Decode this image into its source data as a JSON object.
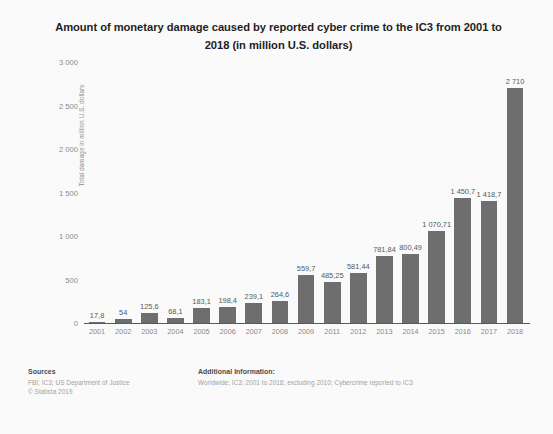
{
  "title": {
    "line1": "Amount of monetary damage caused by reported cyber crime to the IC3 from 2001 to",
    "line2": "2018 (in million U.S. dollars)"
  },
  "axis": {
    "y_title": "Total damage in million U.S. dollars",
    "y_ticks": [
      "3 000",
      "2 500",
      "2 000",
      "1 500",
      "1 000",
      "500",
      "0"
    ]
  },
  "footer": {
    "sources_head": "Sources",
    "sources_line1": "FBI; IC3; US Department of Justice",
    "sources_line2": "© Statista 2019",
    "info_head": "Additional Information:",
    "info_line1": "Worldwide; IC3; 2001 to 2018; excluding 2010; Cybercrime reported to IC3"
  },
  "colors": {
    "bar": "#6e6e6e",
    "axis": "#5a5a5a",
    "tick_text": "#8a8a8a",
    "background": "#fafafa"
  },
  "chart_data": {
    "type": "bar",
    "title": "Amount of monetary damage caused by reported cyber crime to the IC3 from 2001 to 2018 (in million U.S. dollars)",
    "xlabel": "",
    "ylabel": "Total damage in million U.S. dollars",
    "ylim": [
      0,
      3000
    ],
    "ytick_step": 500,
    "grid": false,
    "legend": "none",
    "categories": [
      "2001",
      "2002",
      "2003",
      "2004",
      "2005",
      "2006",
      "2007",
      "2008",
      "2009",
      "2011",
      "2012",
      "2013",
      "2014",
      "2015",
      "2016",
      "2017",
      "2018"
    ],
    "values": [
      17.8,
      54,
      125.6,
      68.1,
      183.1,
      198.4,
      239.1,
      264.6,
      559.7,
      485.25,
      581.44,
      781.84,
      800.49,
      1070.71,
      1450.7,
      1418.7,
      2710
    ],
    "value_labels": [
      "17,8",
      "54",
      "125,6",
      "68,1",
      "183,1",
      "198,4",
      "239,1",
      "264,6",
      "559,7",
      "485,25",
      "581,44",
      "781,84",
      "800,49",
      "1 070,71",
      "1 450,7",
      "1 418,7",
      "2 710"
    ],
    "note": "2010 excluded from the series"
  }
}
